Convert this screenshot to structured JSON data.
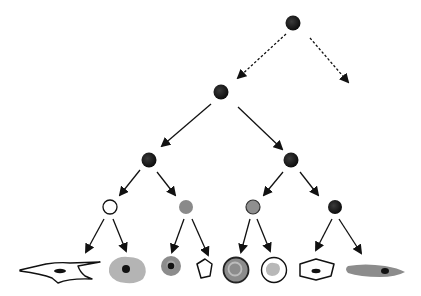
{
  "diagram": {
    "type": "lineage-tree",
    "colors": {
      "background": "#ffffff",
      "node_dark": "#1a1a1a",
      "node_gray": "#8a8a8a",
      "node_white": "#ffffff",
      "cell_gray_light": "#b4b4b4",
      "cell_gray_mid": "#8c8c8c",
      "stroke": "#111111"
    },
    "nodes": [
      {
        "id": "root",
        "x": 293,
        "y": 23,
        "r": 7,
        "fill": "dark",
        "level": 0
      },
      {
        "id": "l1",
        "x": 221,
        "y": 92,
        "r": 7,
        "fill": "dark",
        "level": 1
      },
      {
        "id": "l2-left",
        "x": 149,
        "y": 160,
        "r": 7,
        "fill": "dark",
        "level": 2
      },
      {
        "id": "l2-right",
        "x": 291,
        "y": 160,
        "r": 7,
        "fill": "dark",
        "level": 2
      },
      {
        "id": "l3-1",
        "x": 110,
        "y": 207,
        "r": 7,
        "fill": "white",
        "level": 3
      },
      {
        "id": "l3-2",
        "x": 186,
        "y": 207,
        "r": 7,
        "fill": "gray",
        "level": 3
      },
      {
        "id": "l3-3",
        "x": 253,
        "y": 207,
        "r": 7,
        "fill": "gray-outlined",
        "level": 3
      },
      {
        "id": "l3-4",
        "x": 335,
        "y": 207,
        "r": 7,
        "fill": "dark",
        "level": 3
      }
    ],
    "edges": [
      {
        "from": [
          286,
          34
        ],
        "to": [
          238,
          78
        ],
        "style": "dashed"
      },
      {
        "from": [
          310,
          38
        ],
        "to": [
          348,
          82
        ],
        "style": "dashed"
      },
      {
        "from": [
          211,
          104
        ],
        "to": [
          162,
          146
        ],
        "style": "solid"
      },
      {
        "from": [
          238,
          107
        ],
        "to": [
          282,
          149
        ],
        "style": "solid"
      },
      {
        "from": [
          140,
          170
        ],
        "to": [
          120,
          195
        ],
        "style": "solid"
      },
      {
        "from": [
          157,
          172
        ],
        "to": [
          175,
          195
        ],
        "style": "solid"
      },
      {
        "from": [
          283,
          172
        ],
        "to": [
          264,
          195
        ],
        "style": "solid"
      },
      {
        "from": [
          300,
          172
        ],
        "to": [
          318,
          195
        ],
        "style": "solid"
      },
      {
        "from": [
          104,
          219
        ],
        "to": [
          86,
          252
        ],
        "style": "solid"
      },
      {
        "from": [
          113,
          219
        ],
        "to": [
          126,
          251
        ],
        "style": "solid"
      },
      {
        "from": [
          184,
          219
        ],
        "to": [
          172,
          252
        ],
        "style": "solid"
      },
      {
        "from": [
          192,
          219
        ],
        "to": [
          208,
          255
        ],
        "style": "solid"
      },
      {
        "from": [
          250,
          219
        ],
        "to": [
          241,
          252
        ],
        "style": "solid"
      },
      {
        "from": [
          257,
          219
        ],
        "to": [
          270,
          251
        ],
        "style": "solid"
      },
      {
        "from": [
          332,
          219
        ],
        "to": [
          316,
          250
        ],
        "style": "solid"
      },
      {
        "from": [
          339,
          219
        ],
        "to": [
          361,
          253
        ],
        "style": "solid"
      }
    ],
    "cells": [
      {
        "id": "cell-fibroblast",
        "shape": "spindle-outline"
      },
      {
        "id": "cell-gray-blob",
        "shape": "irregular-gray-with-nucleus"
      },
      {
        "id": "cell-small-gray",
        "shape": "small-gray-with-nucleus"
      },
      {
        "id": "cell-pentagon",
        "shape": "pentagon-outline"
      },
      {
        "id": "cell-ring-dark",
        "shape": "dark-ring-with-inner-gray"
      },
      {
        "id": "cell-ring-light",
        "shape": "outlined-circle-with-gray-core"
      },
      {
        "id": "cell-hexagon",
        "shape": "hexagon-with-nucleus"
      },
      {
        "id": "cell-elongated",
        "shape": "elongated-gray-with-nucleus"
      }
    ]
  }
}
